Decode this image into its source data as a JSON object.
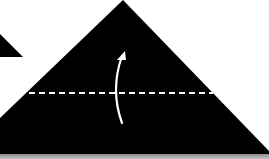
{
  "diagram": {
    "type": "origami-fold-step",
    "colors": {
      "background": "#ffffff",
      "paper": "#000000",
      "fold_line": "#ffffff",
      "arrow": "#ffffff",
      "bottom_band": "#a0a0a0"
    },
    "shapes": {
      "main_triangle": {
        "apex": [
          123,
          0
        ],
        "left_base": [
          0,
          118
        ],
        "right_base": [
          269,
          152
        ],
        "base_y": 154
      },
      "partial_triangle_left": {
        "points": [
          [
            0,
            34
          ],
          [
            23,
            57
          ],
          [
            0,
            57
          ]
        ]
      },
      "valley_fold_line": {
        "x1": 29,
        "x2": 213,
        "y": 93,
        "dash": 6,
        "gap": 4,
        "style": "dashed"
      },
      "fold_arrow": {
        "start": [
          122,
          123
        ],
        "control": [
          112,
          88
        ],
        "end": [
          124,
          52
        ],
        "direction": "up"
      }
    },
    "instruction": "Fold the bottom edge up along the dashed line"
  }
}
